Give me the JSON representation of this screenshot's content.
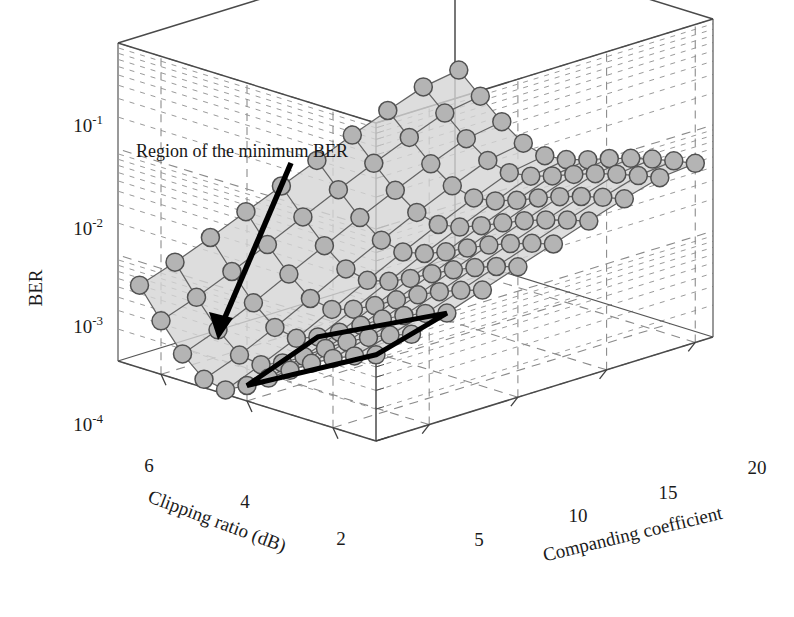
{
  "figure": {
    "kind": "3d-surface-plot",
    "background_color": "#ffffff",
    "width": 794,
    "height": 617
  },
  "annotation": {
    "label": "Region of the minimum BER",
    "arrow": "arrow-to-minimum-region",
    "region_outline_color": "#000000"
  },
  "axes": {
    "z": {
      "title": "BER",
      "scale": "log",
      "tick_labels": [
        "10⁻¹",
        "10⁻²",
        "10⁻³",
        "10⁻⁴"
      ],
      "tick_mantissa": [
        "10",
        "10",
        "10",
        "10"
      ],
      "tick_exponents": [
        "-1",
        "-2",
        "-3",
        "-4"
      ],
      "range": [
        0.0001,
        0.1
      ]
    },
    "x": {
      "title": "Clipping ratio (dB)",
      "tick_labels": [
        "6",
        "4",
        "2"
      ],
      "range": [
        1,
        7
      ],
      "direction": "decreasing-left-to-right"
    },
    "y": {
      "title": "Companding coefficient",
      "tick_labels": [
        "5",
        "10",
        "15",
        "20"
      ],
      "range": [
        2,
        21
      ]
    }
  },
  "style": {
    "marker_face": "#b4b4b4",
    "marker_edge": "#515151",
    "mesh_line": "#646464",
    "facet_fill": "#d4d4d4",
    "grid_dash": "#8a8a8a",
    "frame": "#4a4a4a",
    "text": "#1b1b1b"
  },
  "chart_data": {
    "type": "surface",
    "title": "",
    "xlabel": "Clipping ratio (dB)",
    "ylabel": "Companding coefficient",
    "zlabel": "BER",
    "zscale": "log",
    "zlim": [
      0.0001,
      0.1
    ],
    "xlim": [
      1,
      7
    ],
    "ylim": [
      2,
      21
    ],
    "grid": true,
    "legend": null,
    "annotations": [
      {
        "text": "Region of the minimum BER",
        "points_to": {
          "clipping_ratio": 5.0,
          "companding_coefficient": 4.0
        },
        "style": "thick-black-arrow"
      },
      {
        "text": "",
        "shape": "quadrilateral-outline",
        "encloses": {
          "clipping_ratio": [
            4.0,
            7.0
          ],
          "companding_coefficient": [
            2.0,
            6.0
          ]
        },
        "style": "thick-black-polygon"
      }
    ],
    "x": [
      7.0,
      6.5,
      6.0,
      5.5,
      5.0,
      4.5,
      4.0,
      3.5,
      3.0,
      2.5,
      2.0,
      1.5
    ],
    "y": [
      2,
      4,
      6,
      8,
      10,
      12,
      14,
      16,
      18,
      20
    ],
    "z_rows_note": "rows indexed by companding coefficient y, columns by clipping ratio x; values are BER",
    "z": [
      [
        0.00065,
        0.00055,
        0.00045,
        0.00035,
        0.00026,
        0.00019,
        0.00014,
        0.00011,
        0.00012,
        0.00018,
        0.00032,
        0.0006
      ],
      [
        0.0008,
        0.00068,
        0.00056,
        0.00044,
        0.00033,
        0.00024,
        0.00018,
        0.00015,
        0.00016,
        0.00024,
        0.00042,
        0.00078
      ],
      [
        0.001,
        0.00086,
        0.00071,
        0.00057,
        0.00043,
        0.00032,
        0.00025,
        0.00021,
        0.00023,
        0.00034,
        0.00058,
        0.00105
      ],
      [
        0.0013,
        0.00112,
        0.00094,
        0.00076,
        0.00059,
        0.00045,
        0.00036,
        0.00031,
        0.00034,
        0.0005,
        0.00082,
        0.00145
      ],
      [
        0.0017,
        0.00148,
        0.00125,
        0.00103,
        0.00082,
        0.00064,
        0.00052,
        0.00046,
        0.00051,
        0.00073,
        0.00118,
        0.002
      ],
      [
        0.0022,
        0.00193,
        0.00166,
        0.00139,
        0.00113,
        0.0009,
        0.00075,
        0.00067,
        0.00075,
        0.00106,
        0.00168,
        0.00275
      ],
      [
        0.00285,
        0.00252,
        0.00219,
        0.00186,
        0.00154,
        0.00125,
        0.00105,
        0.00096,
        0.00108,
        0.00151,
        0.00235,
        0.00375
      ],
      [
        0.00365,
        0.00326,
        0.00287,
        0.00247,
        0.00208,
        0.00171,
        0.00146,
        0.00135,
        0.00152,
        0.00212,
        0.00325,
        0.00505
      ],
      [
        0.00455,
        0.00412,
        0.00367,
        0.00321,
        0.00274,
        0.00229,
        0.00197,
        0.00184,
        0.00208,
        0.00288,
        0.00435,
        0.00665
      ],
      [
        0.0049,
        0.00448,
        0.00402,
        0.00354,
        0.00305,
        0.00257,
        0.00223,
        0.0021,
        0.00238,
        0.00329,
        0.00495,
        0.00755
      ]
    ]
  }
}
